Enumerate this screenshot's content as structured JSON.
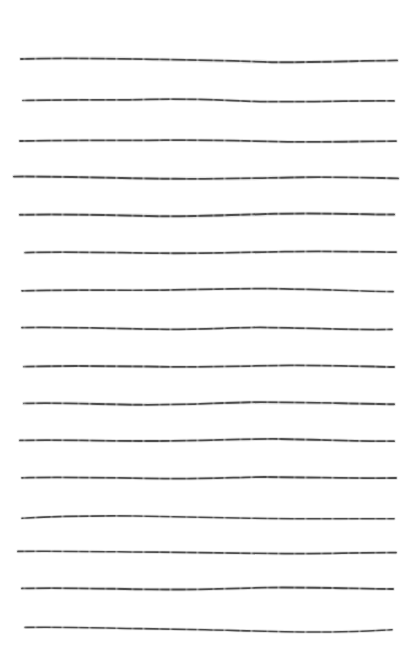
{
  "document": {
    "kind": "ruled-paper-sheet",
    "title": "Hand-drawn ruled lines",
    "width": 416,
    "height": 662,
    "background_color": "#ffffff",
    "ink_color": "#4d4d4d",
    "line_count": 16,
    "style": "hand-drawn ink strokes, slightly wavy, dry-brush gaps",
    "caption": "",
    "lines": [
      {
        "index": 1,
        "name": "ruled-line-1",
        "y": 58,
        "x_start": 21,
        "x_end": 397,
        "thickness": 1.9,
        "path": "M21,59 C60,57.5 110,58.6 160,59.4 C210,60.2 250,61.4 272,62.2 C300,62.6 340,61.4 397,60.4"
      },
      {
        "index": 2,
        "name": "ruled-line-2",
        "y": 99,
        "x_start": 23,
        "x_end": 394,
        "thickness": 1.7,
        "path": "M23,100.5 C70,99.2 110,100.6 150,99.4 C195,98.2 230,100.8 265,101.6 C305,102.2 350,100.4 394,100.9"
      },
      {
        "index": 3,
        "name": "ruled-line-3",
        "y": 140,
        "x_start": 20,
        "x_end": 396,
        "thickness": 1.8,
        "path": "M20,141 C65,139.6 115,140.8 165,140.2 C215,139.6 255,141.4 295,141.9 C330,142.2 365,141.2 396,141.1"
      },
      {
        "index": 4,
        "name": "ruled-line-4",
        "y": 177,
        "x_start": 14,
        "x_end": 398,
        "thickness": 1.9,
        "path": "M14,176.6 C60,176.2 120,178.2 175,178.8 C225,179.2 265,177.8 305,177.2 C340,176.8 370,177.8 398,178.4"
      },
      {
        "index": 5,
        "name": "ruled-line-5",
        "y": 214,
        "x_start": 20,
        "x_end": 394,
        "thickness": 2.0,
        "path": "M20,214.8 C70,213.6 120,215.6 165,216.2 C205,216.6 240,214.6 275,213.8 C320,212.8 355,214.0 394,214.6"
      },
      {
        "index": 6,
        "name": "ruled-line-6",
        "y": 252,
        "x_start": 25,
        "x_end": 396,
        "thickness": 1.8,
        "path": "M25,252.6 C70,251.4 115,252.8 160,253.2 C205,253.6 245,252.4 285,251.6 C325,250.8 360,251.6 396,252.1"
      },
      {
        "index": 7,
        "name": "ruled-line-7",
        "y": 290,
        "x_start": 22,
        "x_end": 393,
        "thickness": 1.7,
        "path": "M22,290.8 C65,289.4 110,290.6 155,290.2 C200,289.6 235,288.2 270,288.6 C315,289.2 355,291.0 393,291.6"
      },
      {
        "index": 8,
        "name": "ruled-line-8",
        "y": 328,
        "x_start": 22,
        "x_end": 392,
        "thickness": 1.7,
        "path": "M22,327.6 C65,326.8 110,328.6 155,329.2 C195,329.8 225,327.8 260,327.4 C305,327.8 350,330.2 392,329.4"
      },
      {
        "index": 9,
        "name": "ruled-line-9",
        "y": 366,
        "x_start": 24,
        "x_end": 394,
        "thickness": 1.8,
        "path": "M24,366.6 C70,365.2 120,366.2 170,366.8 C215,367.2 250,365.8 290,365.4 C330,365.2 365,366.4 394,367.0"
      },
      {
        "index": 10,
        "name": "ruled-line-10",
        "y": 403,
        "x_start": 24,
        "x_end": 394,
        "thickness": 1.9,
        "path": "M24,403.4 C60,402.2 100,404.4 140,404.8 C185,405.2 215,402.8 250,402.2 C300,401.8 350,403.8 394,404.2"
      },
      {
        "index": 11,
        "name": "ruled-line-11",
        "y": 440,
        "x_start": 20,
        "x_end": 394,
        "thickness": 1.8,
        "path": "M20,440.4 C60,439.4 110,441.2 160,441.0 C210,440.6 245,438.6 280,439.0 C325,439.8 360,441.4 394,441.2"
      },
      {
        "index": 12,
        "name": "ruled-line-12",
        "y": 477,
        "x_start": 22,
        "x_end": 396,
        "thickness": 1.8,
        "path": "M22,477.8 C65,476.4 115,478.2 165,478.6 C205,479.0 235,477.4 265,477.0 C315,477.2 360,478.6 396,478.0"
      },
      {
        "index": 13,
        "name": "ruled-line-13",
        "y": 517,
        "x_start": 22,
        "x_end": 394,
        "thickness": 1.6,
        "path": "M22,518.2 C55,516.4 95,515.6 135,516.0 C180,516.6 215,517.8 250,518.2 C300,519.2 350,518.4 394,518.8"
      },
      {
        "index": 14,
        "name": "ruled-line-14",
        "y": 552,
        "x_start": 18,
        "x_end": 396,
        "thickness": 1.7,
        "path": "M18,551.4 C60,550.8 110,551.8 160,552.2 C205,552.6 245,553.4 285,553.6 C325,553.6 365,552.4 396,552.6"
      },
      {
        "index": 15,
        "name": "ruled-line-15",
        "y": 588,
        "x_start": 22,
        "x_end": 393,
        "thickness": 1.8,
        "path": "M22,588.4 C60,587.2 105,588.8 150,589.4 C195,590.0 230,588.4 265,587.6 C310,587.0 355,588.6 393,589.0"
      },
      {
        "index": 16,
        "name": "ruled-line-16",
        "y": 629,
        "x_start": 25,
        "x_end": 392,
        "thickness": 1.6,
        "path": "M25,627.4 C60,626.6 100,628.0 140,628.6 C175,629.2 195,629.6 205,629.8 C250,630.8 290,632.2 330,632.0 C360,631.6 378,630.4 392,629.8"
      }
    ]
  }
}
